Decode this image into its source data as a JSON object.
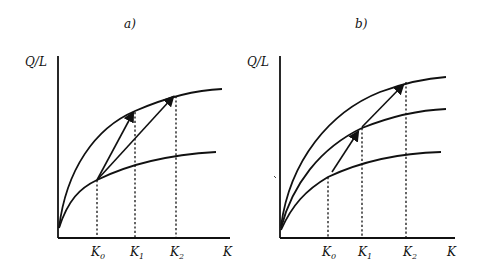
{
  "panels": [
    {
      "id": "a",
      "title": "a)",
      "y_label": "Q/L",
      "x_label": "K",
      "ticks": [
        "K0",
        "K1",
        "K2"
      ],
      "tick_labels": [
        {
          "main": "K",
          "sub": "0"
        },
        {
          "main": "K",
          "sub": "1"
        },
        {
          "main": "K",
          "sub": "2"
        }
      ],
      "curves": [
        "upper production function",
        "lower production function"
      ],
      "arrows": [
        {
          "from": "K0 on lower curve",
          "to": "K1 on upper curve"
        },
        {
          "from": "K0 on lower curve",
          "to": "K2 on upper curve"
        }
      ]
    },
    {
      "id": "b",
      "title": "b)",
      "y_label": "Q/L",
      "x_label": "K",
      "ticks": [
        "K0",
        "K1",
        "K2"
      ],
      "tick_labels": [
        {
          "main": "K",
          "sub": "0"
        },
        {
          "main": "K",
          "sub": "1"
        },
        {
          "main": "K",
          "sub": "2"
        }
      ],
      "curves": [
        "upper production function",
        "middle production function",
        "lower production function"
      ],
      "arrows": [
        {
          "from": "K0 on lower curve",
          "to": "K1 on middle curve"
        },
        {
          "from": "K1 on middle curve",
          "to": "K2 on upper curve"
        }
      ]
    }
  ]
}
